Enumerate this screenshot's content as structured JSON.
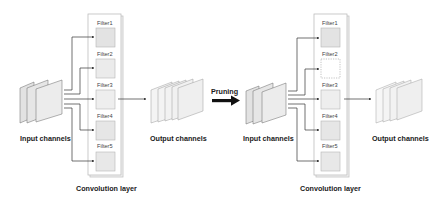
{
  "diagram": {
    "colors": {
      "filter_fill": "#e6e6e6",
      "plane_fill": "#ececec",
      "output_plane_fill": "#f4f4f4",
      "line": "#333333",
      "box_border": "#bdbdbd",
      "arrow": "#111111"
    },
    "before": {
      "input_label": "Input channels",
      "input_planes": 3,
      "layer_label": "Convolution layer",
      "filters": [
        {
          "label": "Filter1",
          "pruned": false
        },
        {
          "label": "Filter2",
          "pruned": false
        },
        {
          "label": "Filter3",
          "pruned": false
        },
        {
          "label": "Filter4",
          "pruned": false
        },
        {
          "label": "Filter5",
          "pruned": false
        }
      ],
      "output_label": "Output channels",
      "output_planes": 5
    },
    "transition": {
      "label": "Pruning"
    },
    "after": {
      "input_label": "Input channels",
      "input_planes": 3,
      "layer_label": "Convolution layer",
      "filters": [
        {
          "label": "Filter1",
          "pruned": false
        },
        {
          "label": "Filter2",
          "pruned": true
        },
        {
          "label": "Filter3",
          "pruned": false
        },
        {
          "label": "Filter4",
          "pruned": false
        },
        {
          "label": "Filter5",
          "pruned": false
        }
      ],
      "output_label": "Output channels",
      "output_planes": 4
    }
  }
}
